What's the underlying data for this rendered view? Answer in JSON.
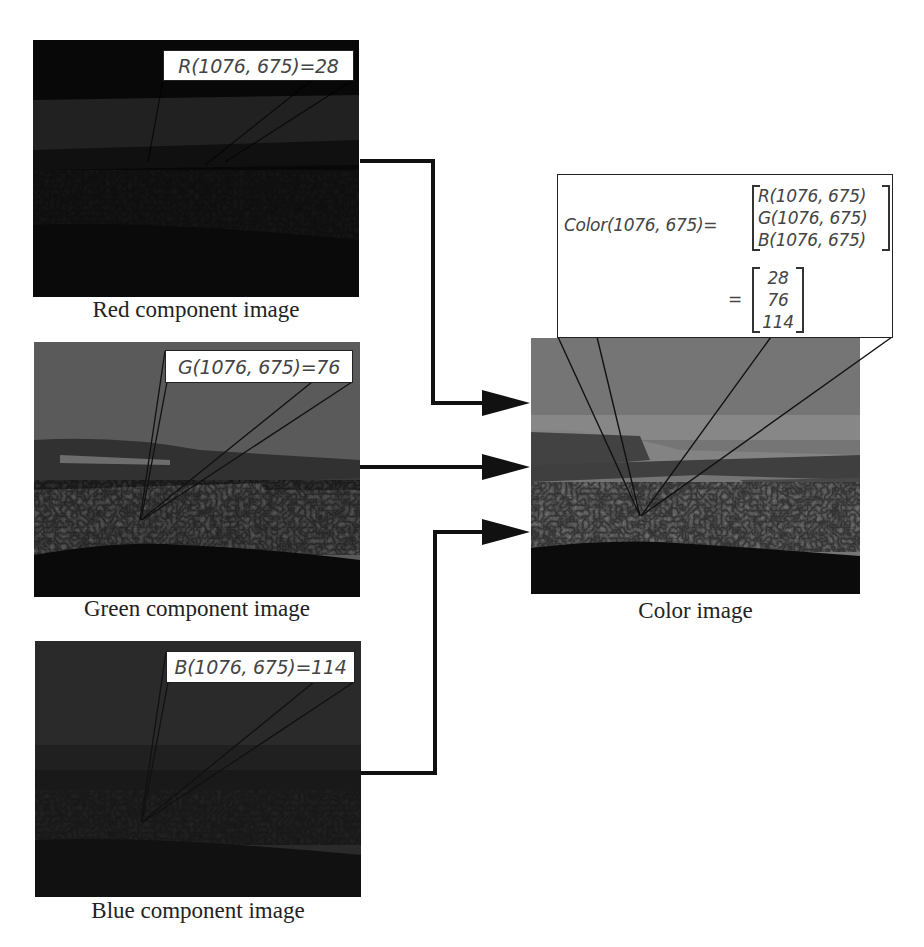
{
  "pixel": {
    "x": 1076,
    "y": 675
  },
  "components": [
    {
      "id": "red",
      "caption": "Red component image",
      "label": "R(1076, 675)=28",
      "value": 28,
      "tone": "dark",
      "colors": {
        "sky": "#0d0d0d",
        "band": "#3a3a3a",
        "ground": "#262626",
        "bottom": "#141414"
      }
    },
    {
      "id": "green",
      "caption": "Green component image",
      "label": "G(1076, 675)=76",
      "value": 76,
      "tone": "mid",
      "colors": {
        "sky": "#a9a9a9",
        "band": "#5e5e5e",
        "ground": "#9d9d9d",
        "bottom": "#151515"
      }
    },
    {
      "id": "blue",
      "caption": "Blue component image",
      "label": "B(1076, 675)=114",
      "value": 114,
      "tone": "dark-mid",
      "colors": {
        "sky": "#474747",
        "band": "#2e2e2e",
        "ground": "#3a3a3a",
        "bottom": "#1c1c1c"
      }
    }
  ],
  "color_image": {
    "caption": "Color image",
    "colors": {
      "sky": "#c8c8c8",
      "haze": "#e3e3e3",
      "band": "#6e6e6e",
      "ground": "#b0b0b0",
      "bottom": "#151515"
    }
  },
  "formula": {
    "lhs": "Color(1076, 675)=",
    "symbolic": [
      "R(1076, 675)",
      "G(1076, 675)",
      "B(1076, 675)"
    ],
    "equals": "=",
    "numeric": [
      "28",
      "76",
      "114"
    ]
  },
  "arrows": [
    {
      "from": "red",
      "to": "color_image",
      "icon": "arrow-right"
    },
    {
      "from": "green",
      "to": "color_image",
      "icon": "arrow-right"
    },
    {
      "from": "blue",
      "to": "color_image",
      "icon": "arrow-right"
    }
  ]
}
